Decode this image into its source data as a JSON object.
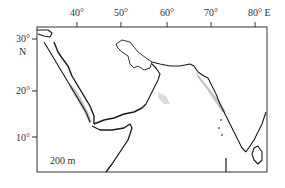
{
  "map": {
    "longitude_labels": [
      {
        "label": "40°",
        "x": 77
      },
      {
        "label": "50°",
        "x": 121
      },
      {
        "label": "60°",
        "x": 167
      },
      {
        "label": "70°",
        "x": 211
      },
      {
        "label": "80° E",
        "x": 255
      }
    ],
    "latitude_labels": [
      {
        "label": "30°",
        "y": 39
      },
      {
        "label": "20°",
        "y": 91
      },
      {
        "label": "10°",
        "y": 137
      }
    ],
    "hemisphere_label": "N",
    "depth_label": "200 m",
    "colors": {
      "frame": "#333333",
      "coastline": "#1a1a1a",
      "shelf_shading": "#b5b5b5",
      "background": "#ffffff"
    }
  }
}
